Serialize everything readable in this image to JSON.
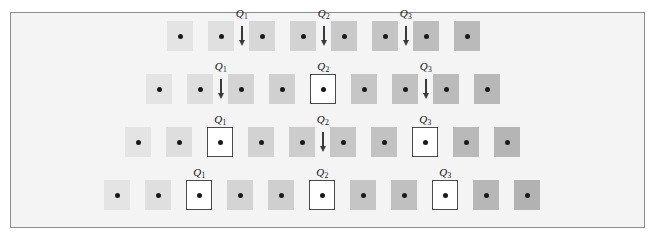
{
  "figure": {
    "background_color": "#f4f4f4",
    "border_color": "#8d8d8d",
    "dot_color": "#1a1a1a",
    "arrow_color": "#3a3a3a",
    "box_outline_color": "#4a4a4a",
    "box_fill_color": "#ffffff",
    "marker_labels": [
      "Q1",
      "Q2",
      "Q3"
    ],
    "rows": [
      {
        "row_index": 1,
        "name": "row-1",
        "y": 20,
        "start_x": 166,
        "pitch": 41,
        "squares": [
          {
            "index": 1,
            "fill": "#e4e4e4",
            "boxed": false
          },
          {
            "index": 2,
            "fill": "#e0e0e0",
            "boxed": false
          },
          {
            "index": 3,
            "fill": "#d7d7d7",
            "boxed": false
          },
          {
            "index": 4,
            "fill": "#d2d2d2",
            "boxed": false
          },
          {
            "index": 5,
            "fill": "#c9c9c9",
            "boxed": false
          },
          {
            "index": 6,
            "fill": "#c4c4c4",
            "boxed": false
          },
          {
            "index": 7,
            "fill": "#bdbdbd",
            "boxed": false
          },
          {
            "index": 8,
            "fill": "#bababa",
            "boxed": false
          }
        ],
        "markers": [
          {
            "label": "Q1",
            "sub": "1",
            "type": "arrow",
            "after_square": 2
          },
          {
            "label": "Q2",
            "sub": "2",
            "type": "arrow",
            "after_square": 4
          },
          {
            "label": "Q3",
            "sub": "3",
            "type": "arrow",
            "after_square": 6
          }
        ]
      },
      {
        "row_index": 2,
        "name": "row-2",
        "y": 73,
        "start_x": 145,
        "pitch": 41,
        "squares": [
          {
            "index": 1,
            "fill": "#e4e4e4",
            "boxed": false
          },
          {
            "index": 2,
            "fill": "#dedede",
            "boxed": false
          },
          {
            "index": 3,
            "fill": "#d4d4d4",
            "boxed": false
          },
          {
            "index": 4,
            "fill": "#d0d0d0",
            "boxed": false
          },
          {
            "index": 5,
            "fill": "#ffffff",
            "boxed": true
          },
          {
            "index": 6,
            "fill": "#c6c6c6",
            "boxed": false
          },
          {
            "index": 7,
            "fill": "#c1c1c1",
            "boxed": false
          },
          {
            "index": 8,
            "fill": "#bbbbbb",
            "boxed": false
          },
          {
            "index": 9,
            "fill": "#b8b8b8",
            "boxed": false
          }
        ],
        "markers": [
          {
            "label": "Q1",
            "sub": "1",
            "type": "arrow",
            "after_square": 2
          },
          {
            "label": "Q2",
            "sub": "2",
            "type": "box",
            "on_square": 5
          },
          {
            "label": "Q3",
            "sub": "3",
            "type": "arrow",
            "after_square": 7
          }
        ]
      },
      {
        "row_index": 3,
        "name": "row-3",
        "y": 126,
        "start_x": 124,
        "pitch": 41,
        "squares": [
          {
            "index": 1,
            "fill": "#e4e4e4",
            "boxed": false
          },
          {
            "index": 2,
            "fill": "#dedede",
            "boxed": false
          },
          {
            "index": 3,
            "fill": "#ffffff",
            "boxed": true
          },
          {
            "index": 4,
            "fill": "#d2d2d2",
            "boxed": false
          },
          {
            "index": 5,
            "fill": "#cccccc",
            "boxed": false
          },
          {
            "index": 6,
            "fill": "#c7c7c7",
            "boxed": false
          },
          {
            "index": 7,
            "fill": "#c2c2c2",
            "boxed": false
          },
          {
            "index": 8,
            "fill": "#ffffff",
            "boxed": true
          },
          {
            "index": 9,
            "fill": "#b9b9b9",
            "boxed": false
          },
          {
            "index": 10,
            "fill": "#b5b5b5",
            "boxed": false
          }
        ],
        "markers": [
          {
            "label": "Q1",
            "sub": "1",
            "type": "box",
            "on_square": 3
          },
          {
            "label": "Q2",
            "sub": "2",
            "type": "arrow",
            "after_square": 5
          },
          {
            "label": "Q3",
            "sub": "3",
            "type": "box",
            "on_square": 8
          }
        ]
      },
      {
        "row_index": 4,
        "name": "row-4",
        "y": 179,
        "start_x": 103,
        "pitch": 41,
        "squares": [
          {
            "index": 1,
            "fill": "#e4e4e4",
            "boxed": false
          },
          {
            "index": 2,
            "fill": "#dfdfdf",
            "boxed": false
          },
          {
            "index": 3,
            "fill": "#ffffff",
            "boxed": true
          },
          {
            "index": 4,
            "fill": "#d4d4d4",
            "boxed": false
          },
          {
            "index": 5,
            "fill": "#cfcfcf",
            "boxed": false
          },
          {
            "index": 6,
            "fill": "#ffffff",
            "boxed": true
          },
          {
            "index": 7,
            "fill": "#c5c5c5",
            "boxed": false
          },
          {
            "index": 8,
            "fill": "#c0c0c0",
            "boxed": false
          },
          {
            "index": 9,
            "fill": "#ffffff",
            "boxed": true
          },
          {
            "index": 10,
            "fill": "#b7b7b7",
            "boxed": false
          },
          {
            "index": 11,
            "fill": "#b2b2b2",
            "boxed": false
          }
        ],
        "markers": [
          {
            "label": "Q1",
            "sub": "1",
            "type": "box",
            "on_square": 3
          },
          {
            "label": "Q2",
            "sub": "2",
            "type": "box",
            "on_square": 6
          },
          {
            "label": "Q3",
            "sub": "3",
            "type": "box",
            "on_square": 9
          }
        ]
      }
    ]
  }
}
